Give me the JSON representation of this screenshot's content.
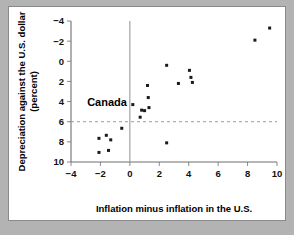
{
  "figure": {
    "background_color": "#b3b3b3",
    "card_color": "#ffffff",
    "border_color": "#8a8a8a"
  },
  "annotation": {
    "canada_label": "Canada"
  },
  "axis_titles": {
    "x": "Inflation minus inflation in the U.S.",
    "y_line1": "Depreciation against the U.S. dollar",
    "y_line2": "(percent)"
  },
  "ticks": {
    "x": [
      "-4",
      "-2",
      "0",
      "2",
      "4",
      "6",
      "8",
      "10"
    ],
    "y": [
      "10",
      "8",
      "6",
      "4",
      "2",
      "0",
      "-2",
      "-4"
    ]
  },
  "chart_data": {
    "type": "scatter",
    "title": "",
    "xlabel": "Inflation minus inflation in the U.S.",
    "ylabel": "Depreciation against the U.S. dollar (percent)",
    "xlim": [
      -4,
      10
    ],
    "ylim": [
      -4,
      10
    ],
    "xticks": [
      -4,
      -2,
      0,
      2,
      4,
      6,
      8,
      10
    ],
    "yticks": [
      -4,
      -2,
      0,
      2,
      4,
      6,
      8,
      10
    ],
    "grid": false,
    "legend": null,
    "reference_lines": [
      {
        "orientation": "vertical",
        "value": 0,
        "style": "solid",
        "color": "#9a9a9a"
      },
      {
        "orientation": "horizontal",
        "value": 0,
        "style": "dashed",
        "color": "#9a9a9a"
      }
    ],
    "annotations": [
      {
        "text": "Canada",
        "x": -1.55,
        "y": 2.0
      }
    ],
    "marker": {
      "shape": "square",
      "color": "#1a1a1a",
      "size": 3
    },
    "points": [
      {
        "x": -2.1,
        "y": -1.65
      },
      {
        "x": -2.1,
        "y": -3.05
      },
      {
        "x": -1.6,
        "y": -1.35
      },
      {
        "x": -1.45,
        "y": -2.85
      },
      {
        "x": -1.3,
        "y": -1.8
      },
      {
        "x": -0.55,
        "y": -0.65
      },
      {
        "x": 0.2,
        "y": 1.7
      },
      {
        "x": 0.7,
        "y": 0.45
      },
      {
        "x": 0.8,
        "y": 1.15
      },
      {
        "x": 1.0,
        "y": 1.1
      },
      {
        "x": 1.2,
        "y": 3.6
      },
      {
        "x": 1.25,
        "y": 2.4
      },
      {
        "x": 1.3,
        "y": 1.4
      },
      {
        "x": 2.5,
        "y": 5.6
      },
      {
        "x": 2.5,
        "y": -2.1
      },
      {
        "x": 3.3,
        "y": 3.8
      },
      {
        "x": 4.05,
        "y": 5.1
      },
      {
        "x": 4.15,
        "y": 4.4
      },
      {
        "x": 4.25,
        "y": 3.9
      },
      {
        "x": 8.5,
        "y": 8.1
      },
      {
        "x": 9.5,
        "y": 9.3
      }
    ]
  }
}
